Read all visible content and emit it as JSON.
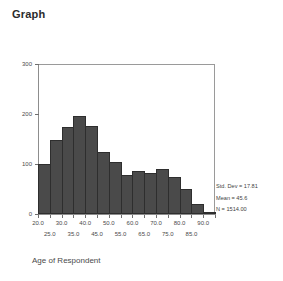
{
  "title": "Graph",
  "chart_data": {
    "type": "bar",
    "title": "Graph",
    "xlabel": "Age of Respondent",
    "ylabel": "",
    "xlim": [
      20.0,
      95.0
    ],
    "ylim": [
      0,
      300
    ],
    "grid": false,
    "legend": "none",
    "bin_width": 5,
    "categories": [
      "20.0-25.0",
      "25.0-30.0",
      "30.0-35.0",
      "35.0-40.0",
      "40.0-45.0",
      "45.0-50.0",
      "50.0-55.0",
      "55.0-60.0",
      "60.0-65.0",
      "65.0-70.0",
      "70.0-75.0",
      "75.0-80.0",
      "80.0-85.0",
      "85.0-90.0",
      "90.0-95.0"
    ],
    "bin_starts": [
      20,
      25,
      30,
      35,
      40,
      45,
      50,
      55,
      60,
      65,
      70,
      75,
      80,
      85,
      90
    ],
    "values": [
      100,
      148,
      175,
      197,
      176,
      124,
      105,
      78,
      86,
      83,
      90,
      75,
      50,
      20,
      5
    ],
    "y_ticks": [
      0,
      100,
      200,
      300
    ],
    "y_tick_labels": [
      "0",
      "100",
      "200",
      "300"
    ],
    "x_ticks_row1": [
      20.0,
      30.0,
      40.0,
      50.0,
      60.0,
      70.0,
      80.0,
      90.0
    ],
    "x_tick_labels_row1": [
      "20.0",
      "30.0",
      "40.0",
      "50.0",
      "60.0",
      "70.0",
      "80.0",
      "90.0"
    ],
    "x_ticks_row2": [
      25.0,
      35.0,
      45.0,
      55.0,
      65.0,
      75.0,
      85.0
    ],
    "x_tick_labels_row2": [
      "25.0",
      "35.0",
      "45.0",
      "55.0",
      "65.0",
      "75.0",
      "85.0"
    ],
    "bar_color": "#4a4a4a",
    "bar_edge_color": "#2e2e2e",
    "axis_color": "#8d8d8d",
    "annotations": [
      "Std. Dev = 17.81",
      "Mean = 45.6",
      "N = 1514.00"
    ]
  },
  "stats": {
    "std_dev": "Std. Dev = 17.81",
    "mean": "Mean = 45.6",
    "n": "N = 1514.00"
  },
  "axis": {
    "x_title": "Age of Respondent"
  }
}
